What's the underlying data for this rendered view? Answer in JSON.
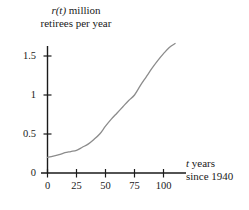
{
  "chart_data": {
    "type": "line",
    "title": "",
    "subtitle": "",
    "ylabel_line1": "r(t) million",
    "ylabel_line2": "retirees per year",
    "ylabel_italic_part": "r(t)",
    "xlabel_line1": "t years",
    "xlabel_line2": "since 1940",
    "xlabel_italic_part": "t",
    "xlim": [
      0,
      112
    ],
    "ylim": [
      0,
      1.72
    ],
    "xticks": [
      0,
      25,
      50,
      75,
      100
    ],
    "xtick_labels": [
      "0",
      "25",
      "50",
      "75",
      "100"
    ],
    "yticks": [
      0,
      0.5,
      1,
      1.5
    ],
    "ytick_labels": [
      "0",
      "0.5",
      "1",
      "1.5"
    ],
    "grid": false,
    "legend": false,
    "series": [
      {
        "name": "r(t)",
        "color": "#8c8c8c",
        "x": [
          0,
          5,
          10,
          15,
          20,
          25,
          30,
          35,
          40,
          45,
          50,
          55,
          60,
          65,
          70,
          75,
          80,
          85,
          90,
          95,
          100,
          105,
          110
        ],
        "y": [
          0.2,
          0.215,
          0.235,
          0.26,
          0.275,
          0.29,
          0.33,
          0.37,
          0.43,
          0.5,
          0.6,
          0.69,
          0.77,
          0.85,
          0.93,
          1.0,
          1.12,
          1.23,
          1.34,
          1.44,
          1.53,
          1.61,
          1.66
        ]
      }
    ],
    "annotations": []
  },
  "figure": {
    "background_color": "#ffffff",
    "axis_color": "#1a1a1a",
    "curve_color": "#8c8c8c",
    "text_color": "#1a1a1a"
  }
}
